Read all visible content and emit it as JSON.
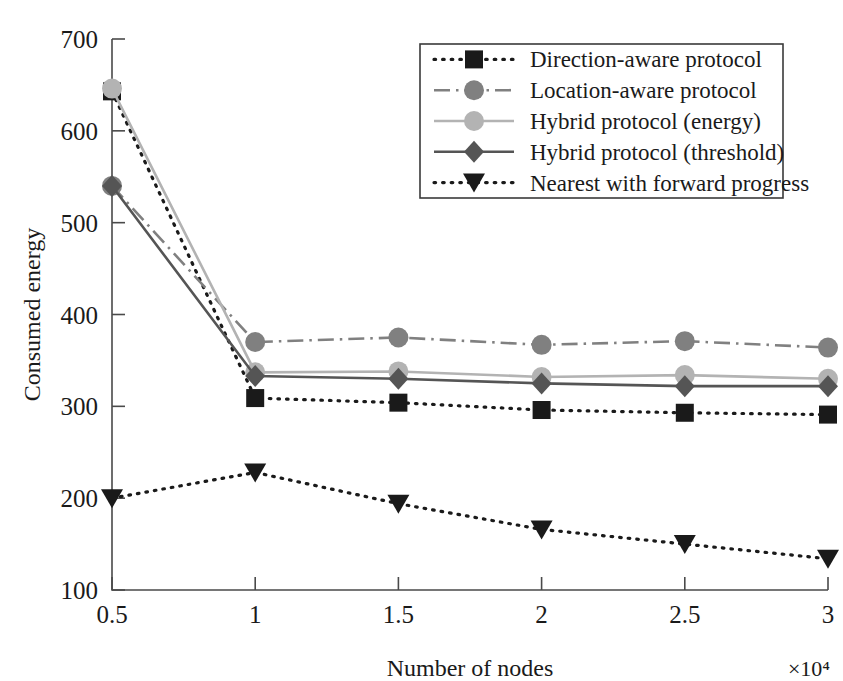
{
  "chart_data": {
    "type": "line",
    "title": "",
    "xlabel": "Number of nodes",
    "ylabel": "Consumed energy",
    "x_multiplier": "×10⁴",
    "x": [
      0.5,
      1,
      1.5,
      2,
      2.5,
      3
    ],
    "xtick_labels": [
      "0.5",
      "1",
      "1.5",
      "2",
      "2.5",
      "3"
    ],
    "ytick_labels": [
      "100",
      "200",
      "300",
      "400",
      "500",
      "600",
      "700"
    ],
    "xlim": [
      0.5,
      3
    ],
    "ylim": [
      100,
      700
    ],
    "grid": false,
    "legend_position": "top-right",
    "series": [
      {
        "name": "Direction-aware protocol",
        "values": [
          643,
          309,
          304,
          296,
          293,
          291
        ],
        "color": "#1a1a1a",
        "line_style": "dotted",
        "marker": "square"
      },
      {
        "name": "Location-aware protocol",
        "values": [
          540,
          370,
          375,
          367,
          371,
          364
        ],
        "color": "#808080",
        "line_style": "dash-dot",
        "marker": "circle"
      },
      {
        "name": "Hybrid protocol (energy)",
        "values": [
          646,
          337,
          338,
          332,
          334,
          330
        ],
        "color": "#b3b3b3",
        "line_style": "solid",
        "marker": "circle"
      },
      {
        "name": "Hybrid protocol (threshold)",
        "values": [
          540,
          333,
          330,
          325,
          322,
          322
        ],
        "color": "#555555",
        "line_style": "solid",
        "marker": "diamond"
      },
      {
        "name": "Nearest with forward progress",
        "values": [
          200,
          228,
          194,
          166,
          150,
          134
        ],
        "color": "#1a1a1a",
        "line_style": "dotted",
        "marker": "triangle-down"
      }
    ]
  },
  "axes": {
    "y_title": "Consumed energy",
    "x_title": "Number of nodes",
    "x_exponent": "×10⁴"
  }
}
